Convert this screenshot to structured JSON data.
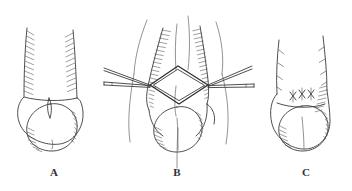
{
  "figure": {
    "type": "medical-line-drawing",
    "title": "",
    "background_color": "#ffffff",
    "ink_color": "#3b3b3b",
    "hatch_color": "#4f4f4f",
    "label_color": "#333333",
    "panel_count": 3
  },
  "panels": [
    {
      "id": "A",
      "label": "A",
      "label_x": 54,
      "label_y": 176,
      "description": "Shaft with hatched lateral margins and rounded glans, midline raphe",
      "features": [
        "shaft-outline",
        "lateral-hatching-left",
        "lateral-hatching-right",
        "coronal-margin",
        "glans-outline",
        "glans-shading",
        "midline-slit"
      ]
    },
    {
      "id": "B",
      "label": "B",
      "label_x": 177,
      "label_y": 176,
      "description": "Diamond-shaped incision held open by four forceps; hatched flaps retracted laterally",
      "features": [
        "diamond-incision",
        "forceps-upper-left",
        "forceps-lower-left",
        "forceps-upper-right",
        "forceps-lower-right",
        "flap-hatching-left",
        "flap-hatching-right",
        "glans-outline",
        "glans-shading",
        "traction-sutures"
      ]
    },
    {
      "id": "C",
      "label": "C",
      "label_x": 306,
      "label_y": 176,
      "description": "Closed wound with three interrupted X sutures at the corona; shaft shows vascular markings",
      "features": [
        "shaft-outline",
        "vein-markings-left",
        "vein-markings-right",
        "suture-x-1",
        "suture-x-2",
        "suture-x-3",
        "coronal-line",
        "glans-outline",
        "glans-shading"
      ]
    }
  ],
  "labels": {
    "a": "A",
    "b": "B",
    "c": "C"
  }
}
